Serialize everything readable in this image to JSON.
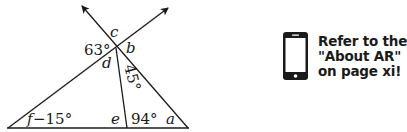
{
  "diagram": {
    "labels": {
      "c": "c",
      "b": "b",
      "d": "d",
      "e": "e",
      "a": "a",
      "angle_63": "63°",
      "angle_45": "45°",
      "angle_94": "94°",
      "f_var": "f",
      "f_expr": "−15°"
    },
    "colors": {
      "stroke": "#1a1a1a"
    }
  },
  "callout": {
    "icon": "smartphone-icon",
    "lines": [
      "Refer to the",
      "\"About AR\"",
      "on page xi!"
    ]
  }
}
